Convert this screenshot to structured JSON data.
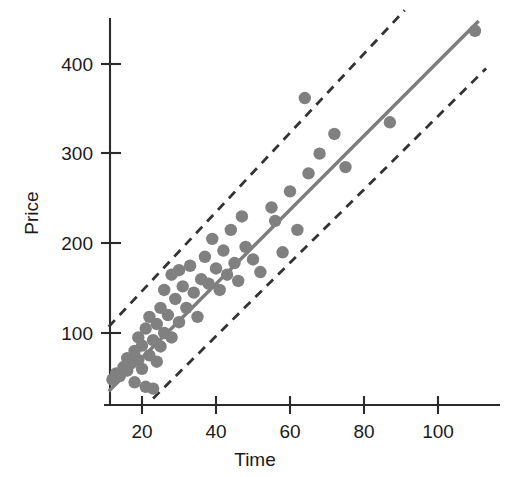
{
  "chart_data": {
    "type": "scatter",
    "title": "",
    "xlabel": "Time",
    "ylabel": "Price",
    "xlim": [
      10,
      115
    ],
    "ylim": [
      20,
      450
    ],
    "xticks": [
      20,
      40,
      60,
      80,
      100
    ],
    "xtick_labels": [
      "20",
      "40",
      "60",
      "80",
      "100"
    ],
    "yticks": [
      100,
      200,
      300,
      400
    ],
    "ytick_labels": [
      "100",
      "200",
      "300",
      "400"
    ],
    "grid": false,
    "legend": "none",
    "point_color": "#808080",
    "fit_line_color": "#7d7d7d",
    "band_line_color": "#333333",
    "axis_color": "#2b2b2b",
    "points": [
      [
        12,
        48
      ],
      [
        13,
        55
      ],
      [
        14,
        52
      ],
      [
        15,
        62
      ],
      [
        16,
        58
      ],
      [
        16,
        72
      ],
      [
        17,
        66
      ],
      [
        18,
        45
      ],
      [
        18,
        80
      ],
      [
        19,
        70
      ],
      [
        19,
        95
      ],
      [
        20,
        60
      ],
      [
        20,
        86
      ],
      [
        21,
        40
      ],
      [
        21,
        105
      ],
      [
        22,
        75
      ],
      [
        22,
        118
      ],
      [
        23,
        92
      ],
      [
        23,
        38
      ],
      [
        24,
        110
      ],
      [
        24,
        68
      ],
      [
        25,
        128
      ],
      [
        25,
        85
      ],
      [
        26,
        100
      ],
      [
        26,
        148
      ],
      [
        27,
        120
      ],
      [
        28,
        165
      ],
      [
        28,
        95
      ],
      [
        29,
        138
      ],
      [
        30,
        112
      ],
      [
        30,
        170
      ],
      [
        31,
        152
      ],
      [
        32,
        128
      ],
      [
        33,
        175
      ],
      [
        34,
        145
      ],
      [
        35,
        118
      ],
      [
        36,
        160
      ],
      [
        37,
        185
      ],
      [
        38,
        155
      ],
      [
        39,
        205
      ],
      [
        40,
        172
      ],
      [
        41,
        148
      ],
      [
        42,
        192
      ],
      [
        43,
        165
      ],
      [
        44,
        215
      ],
      [
        45,
        178
      ],
      [
        46,
        158
      ],
      [
        47,
        230
      ],
      [
        48,
        196
      ],
      [
        50,
        182
      ],
      [
        52,
        168
      ],
      [
        55,
        240
      ],
      [
        56,
        225
      ],
      [
        58,
        190
      ],
      [
        60,
        258
      ],
      [
        62,
        215
      ],
      [
        64,
        362
      ],
      [
        65,
        278
      ],
      [
        68,
        300
      ],
      [
        72,
        322
      ],
      [
        75,
        285
      ],
      [
        87,
        335
      ],
      [
        110,
        437
      ]
    ],
    "series": [
      {
        "name": "regression-line",
        "style": "solid",
        "x": [
          11,
          111
        ],
        "y": [
          35,
          448
        ]
      },
      {
        "name": "upper-band",
        "style": "dashed",
        "x": [
          11,
          91
        ],
        "y": [
          107,
          460
        ]
      },
      {
        "name": "lower-band",
        "style": "dashed",
        "x": [
          23,
          113
        ],
        "y": [
          27,
          395
        ]
      }
    ]
  },
  "axes": {
    "x_axis_name": "time-axis",
    "y_axis_name": "price-axis"
  }
}
